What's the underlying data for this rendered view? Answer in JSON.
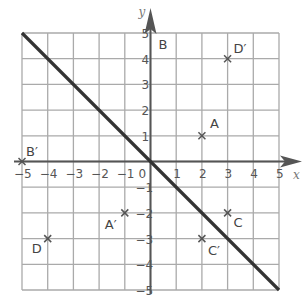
{
  "chart_data": {
    "type": "scatter",
    "title": "",
    "xlabel": "x",
    "ylabel": "y",
    "xlim": [
      -5,
      5
    ],
    "ylim": [
      -5,
      5
    ],
    "grid": true,
    "x_ticks": [
      -5,
      -4,
      -3,
      -2,
      -1,
      0,
      1,
      2,
      3,
      4,
      5
    ],
    "y_ticks": [
      -5,
      -4,
      -3,
      -2,
      -1,
      1,
      2,
      3,
      4,
      5
    ],
    "x_tick_labels": [
      "−5",
      "−4",
      "−3",
      "−2",
      "−1",
      "0",
      "1",
      "2",
      "3",
      "4",
      "5"
    ],
    "y_tick_labels": [
      "−5",
      "−4",
      "−3",
      "−2",
      "−1",
      "1",
      "2",
      "3",
      "4",
      "5"
    ],
    "line": {
      "equation": "y = -x",
      "from": [
        -5,
        5
      ],
      "to": [
        5,
        -5
      ]
    },
    "points": [
      {
        "label": "A",
        "x": 2,
        "y": 1,
        "dx": 8,
        "dy": -8
      },
      {
        "label": "A′",
        "x": -1,
        "y": -2,
        "dx": -20,
        "dy": 16
      },
      {
        "label": "B",
        "x": 0,
        "y": 5,
        "dx": 8,
        "dy": 16,
        "marker": false
      },
      {
        "label": "B′",
        "x": -5,
        "y": 0,
        "dx": 4,
        "dy": -6
      },
      {
        "label": "C",
        "x": 3,
        "y": -2,
        "dx": 6,
        "dy": 14
      },
      {
        "label": "C′",
        "x": 2,
        "y": -3,
        "dx": 6,
        "dy": 16
      },
      {
        "label": "D",
        "x": -4,
        "y": -3,
        "dx": -16,
        "dy": 14
      },
      {
        "label": "D′",
        "x": 3,
        "y": 4,
        "dx": 6,
        "dy": -6
      }
    ]
  },
  "colors": {
    "grid": "#aaaaaa",
    "axis": "#555555",
    "line": "#333333",
    "marker": "#555555"
  }
}
